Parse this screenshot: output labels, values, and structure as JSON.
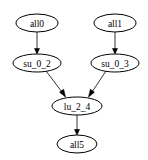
{
  "diagram": {
    "type": "directed-graph",
    "nodes": [
      {
        "id": "all0",
        "label": "all0",
        "cx": 37,
        "cy": 23,
        "rx": 21,
        "ry": 9
      },
      {
        "id": "all1",
        "label": "all1",
        "cx": 115,
        "cy": 23,
        "rx": 21,
        "ry": 9
      },
      {
        "id": "su_0_2",
        "label": "su_0_2",
        "cx": 37,
        "cy": 63,
        "rx": 24,
        "ry": 9
      },
      {
        "id": "su_0_3",
        "label": "su_0_3",
        "cx": 115,
        "cy": 63,
        "rx": 24,
        "ry": 9
      },
      {
        "id": "lu_2_4",
        "label": "lu_2_4",
        "cx": 77,
        "cy": 106,
        "rx": 25,
        "ry": 9
      },
      {
        "id": "all5",
        "label": "all5",
        "cx": 77,
        "cy": 144,
        "rx": 20,
        "ry": 9
      }
    ],
    "edges": [
      {
        "from": "all0",
        "to": "su_0_2"
      },
      {
        "from": "all1",
        "to": "su_0_3"
      },
      {
        "from": "su_0_2",
        "to": "lu_2_4"
      },
      {
        "from": "su_0_3",
        "to": "lu_2_4"
      },
      {
        "from": "lu_2_4",
        "to": "all5"
      }
    ],
    "colors": {
      "stroke": "#000000",
      "fill": "#ffffff",
      "background": "#ffffff"
    }
  }
}
